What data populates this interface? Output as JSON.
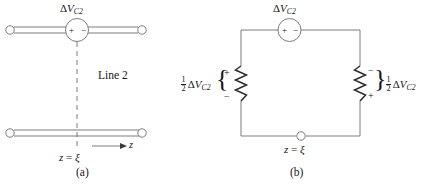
{
  "figure": {
    "background": "#ffffff",
    "stroke_color": "#4a4a4a",
    "text_color": "#161616"
  },
  "panel_a": {
    "caption": "(a)",
    "source_label": {
      "delta": "Δ",
      "v": "V",
      "sub": "C2",
      "full": "ΔV_C2"
    },
    "source_plus": "+",
    "source_minus": "−",
    "line_label": "Line 2",
    "position_label": {
      "z": "z",
      "eq": "=",
      "xi": "ξ",
      "full": "z = ξ"
    },
    "axis_arrow_label": "z",
    "icons": {
      "terminal": "open-terminal-circle",
      "dashed": "dashed-reference-line",
      "arrow": "z-axis-arrow"
    }
  },
  "panel_b": {
    "caption": "(b)",
    "source_label": {
      "delta": "Δ",
      "v": "V",
      "sub": "C2",
      "full": "ΔV_C2"
    },
    "source_plus": "+",
    "source_minus": "−",
    "left_branch": {
      "label_fraction_num": "1",
      "label_fraction_den": "2",
      "label_delta": "Δ",
      "label_v": "V",
      "label_sub": "C2",
      "label_full": "1/2 ΔV_C2",
      "brace": "{",
      "top_sign": "+",
      "bottom_sign": "−",
      "element": "resistor"
    },
    "right_branch": {
      "label_fraction_num": "1",
      "label_fraction_den": "2",
      "label_delta": "Δ",
      "label_v": "V",
      "label_sub": "C2",
      "label_full": "1/2 ΔV_C2",
      "brace": "}",
      "top_sign": "−",
      "bottom_sign": "+",
      "element": "resistor"
    },
    "node_label": {
      "z": "z",
      "eq": "=",
      "xi": "ξ",
      "full": "z = ξ"
    },
    "icons": {
      "node": "open-node-circle",
      "source": "voltage-source-circle"
    }
  }
}
